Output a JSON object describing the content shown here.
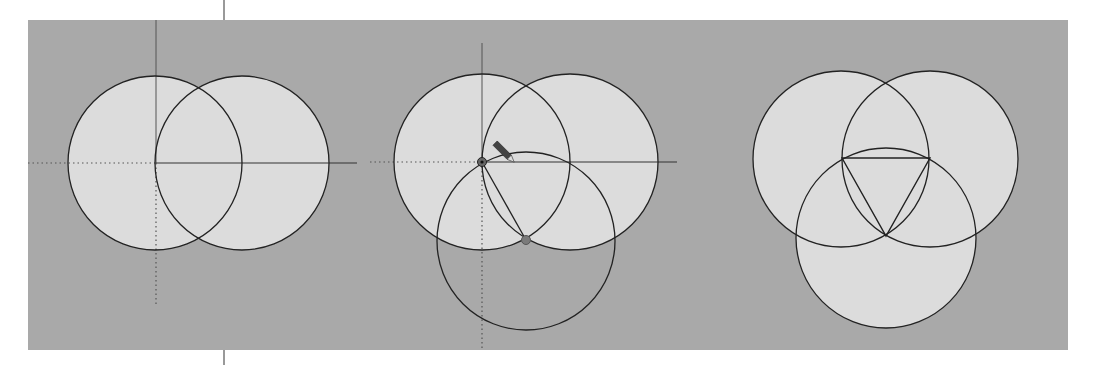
{
  "figure": {
    "colors": {
      "page": "#ffffff",
      "canvas": "#a9a9a9",
      "circle_fill": "#dcdcdc",
      "stroke": "#222222",
      "axis": "#555555",
      "marker": "#7a7a7a"
    },
    "canvas": {
      "x": 28,
      "y": 20,
      "w": 1040,
      "h": 330
    },
    "divider_x": 224,
    "panels": [
      {
        "id": "step-1",
        "axis_origin": [
          156,
          163
        ],
        "axis": {
          "v_top": 20,
          "v_bottom_dotted": 305,
          "h_right": 357,
          "h_left_dotted": 28
        },
        "circles": [
          {
            "cx": 155,
            "cy": 163,
            "r": 87,
            "filled": true
          },
          {
            "cx": 242,
            "cy": 163,
            "r": 87,
            "filled": true
          }
        ],
        "lines": []
      },
      {
        "id": "step-2",
        "axis_origin": [
          482,
          162
        ],
        "axis": {
          "v_top": 43,
          "v_bottom_dotted": 350,
          "h_right": 677,
          "h_left_dotted": 370
        },
        "circles": [
          {
            "cx": 482,
            "cy": 162,
            "r": 88,
            "filled": true
          },
          {
            "cx": 570,
            "cy": 162,
            "r": 88,
            "filled": true
          },
          {
            "cx": 526,
            "cy": 241,
            "r": 89,
            "filled": false
          }
        ],
        "lines": [
          {
            "x1": 482,
            "y1": 162,
            "x2": 526,
            "y2": 240
          }
        ],
        "markers": [
          {
            "name": "origin-snap-point",
            "cx": 482,
            "cy": 162
          },
          {
            "name": "intersection-snap-point",
            "cx": 526,
            "cy": 240
          }
        ],
        "pencil_cursor": {
          "x": 505,
          "y": 153
        }
      },
      {
        "id": "step-3",
        "circles": [
          {
            "cx": 841,
            "cy": 159,
            "r": 88,
            "filled": true
          },
          {
            "cx": 930,
            "cy": 159,
            "r": 88,
            "filled": true
          },
          {
            "cx": 886,
            "cy": 238,
            "r": 90,
            "filled": true
          }
        ],
        "triangle": [
          [
            842,
            158
          ],
          [
            930,
            158
          ],
          [
            886,
            236
          ]
        ]
      }
    ]
  }
}
